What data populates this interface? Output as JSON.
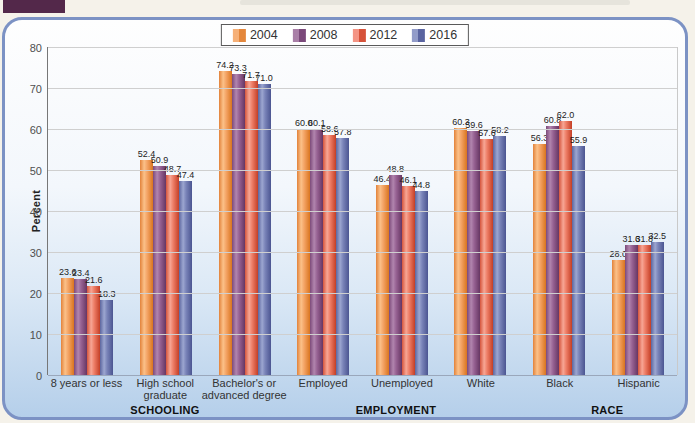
{
  "figure": {
    "tab_color": "#53284a"
  },
  "legend": {
    "items": [
      {
        "label": "2004",
        "light": "#f6b077",
        "dark": "#e4873c"
      },
      {
        "label": "2008",
        "light": "#a97fa7",
        "dark": "#7b497a"
      },
      {
        "label": "2012",
        "light": "#f49484",
        "dark": "#d6523a"
      },
      {
        "label": "2016",
        "light": "#929cc9",
        "dark": "#5a64a0"
      }
    ]
  },
  "chart_data": {
    "type": "bar",
    "ylabel": "Percent",
    "ylim": [
      0,
      80
    ],
    "yticks": [
      0,
      10,
      20,
      30,
      40,
      50,
      60,
      70,
      80
    ],
    "grid": true,
    "legend_position": "top-center",
    "series_names": [
      "2004",
      "2008",
      "2012",
      "2016"
    ],
    "groups": [
      {
        "label": "8 years or less",
        "values": [
          23.6,
          23.4,
          21.6,
          18.3
        ]
      },
      {
        "label": "High school\ngraduate",
        "values": [
          52.4,
          50.9,
          48.7,
          47.4
        ]
      },
      {
        "label": "Bachelor's or\nadvanced degree",
        "values": [
          74.2,
          73.3,
          71.7,
          71.0
        ]
      },
      {
        "label": "Employed",
        "values": [
          60.0,
          60.1,
          58.6,
          57.8
        ]
      },
      {
        "label": "Unemployed",
        "values": [
          46.4,
          48.8,
          46.1,
          44.8
        ]
      },
      {
        "label": "White",
        "values": [
          60.3,
          59.6,
          57.6,
          58.2
        ]
      },
      {
        "label": "Black",
        "values": [
          56.3,
          60.8,
          62.0,
          55.9
        ]
      },
      {
        "label": "Hispanic",
        "values": [
          28.0,
          31.6,
          31.8,
          32.5
        ]
      }
    ],
    "sections": [
      {
        "label": "SCHOOLING",
        "center_pct": 18.7
      },
      {
        "label": "EMPLOYMENT",
        "center_pct": 55.3
      },
      {
        "label": "RACE",
        "center_pct": 88.8
      }
    ]
  }
}
